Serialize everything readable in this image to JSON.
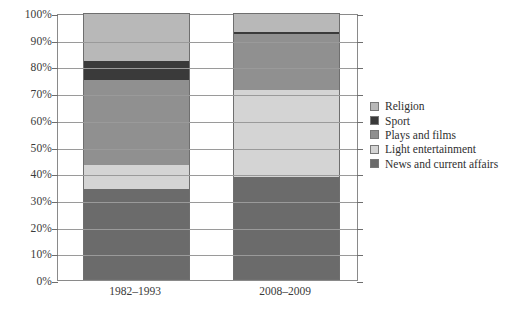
{
  "chart_data": {
    "type": "bar",
    "stacked": true,
    "normalized": "100%",
    "title": "",
    "subtitle": "",
    "xlabel": "",
    "ylabel": "",
    "categories": [
      "1982–1993",
      "2008–2009"
    ],
    "ylim": [
      0,
      100
    ],
    "ytick_labels": [
      "0%",
      "10%",
      "20%",
      "30%",
      "40%",
      "50%",
      "60%",
      "70%",
      "80%",
      "90%",
      "100%"
    ],
    "ytick_values": [
      0,
      10,
      20,
      30,
      40,
      50,
      60,
      70,
      80,
      90,
      100
    ],
    "grid": true,
    "legend_position": "right",
    "series_order_bottom_to_top": [
      "News and current affairs",
      "Light entertainment",
      "Plays and films",
      "Sport",
      "Religion"
    ],
    "series": [
      {
        "name": "Religion",
        "color": "#b8b8b8",
        "values": [
          18,
          7
        ],
        "cumulative_top": [
          100,
          100
        ],
        "cumulative_bottom": [
          82,
          93
        ]
      },
      {
        "name": "Sport",
        "color": "#3a3a3a",
        "values": [
          7,
          1
        ],
        "cumulative_top": [
          82,
          93
        ],
        "cumulative_bottom": [
          75,
          92
        ]
      },
      {
        "name": "Plays and films",
        "color": "#909090",
        "values": [
          32,
          21
        ],
        "cumulative_top": [
          75,
          92
        ],
        "cumulative_bottom": [
          43,
          71
        ]
      },
      {
        "name": "Light entertainment",
        "color": "#d4d4d4",
        "values": [
          9,
          32.5
        ],
        "cumulative_top": [
          43,
          71
        ],
        "cumulative_bottom": [
          34,
          38.5
        ]
      },
      {
        "name": "News and current affairs",
        "color": "#6b6b6b",
        "values": [
          34,
          38.5
        ],
        "cumulative_top": [
          34,
          38.5
        ],
        "cumulative_bottom": [
          0,
          0
        ]
      }
    ]
  },
  "legend": {
    "items": [
      {
        "label": "Religion",
        "color": "#b8b8b8"
      },
      {
        "label": "Sport",
        "color": "#3a3a3a"
      },
      {
        "label": "Plays and films",
        "color": "#909090"
      },
      {
        "label": "Light entertainment",
        "color": "#d4d4d4"
      },
      {
        "label": "News and current affairs",
        "color": "#6b6b6b"
      }
    ]
  },
  "axes": {
    "y_ticks": [
      "100%",
      "90%",
      "80%",
      "70%",
      "60%",
      "50%",
      "40%",
      "30%",
      "20%",
      "10%",
      "0%"
    ],
    "x_ticks": [
      "1982–1993",
      "2008–2009"
    ]
  },
  "colors": {
    "frame": "#8a8a8a",
    "grid": "#9a9a9a",
    "text": "#2f2f2f",
    "background": "#ffffff"
  }
}
